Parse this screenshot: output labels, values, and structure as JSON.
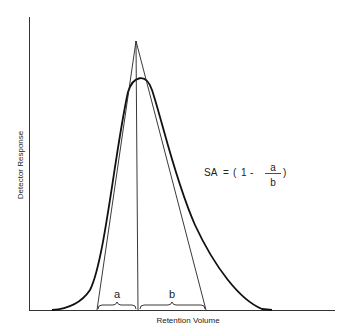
{
  "diagram": {
    "type": "chromatographic-peak-asymmetry",
    "x_axis_label": "Retention Volume",
    "y_axis_label": "Detector Response",
    "segment_labels": {
      "left": "a",
      "right": "b"
    },
    "formula": {
      "lhs": "SA",
      "equals": "=",
      "open": "(",
      "one": "1",
      "minus": "-",
      "numerator": "a",
      "denominator": "b",
      "close": ")"
    }
  }
}
